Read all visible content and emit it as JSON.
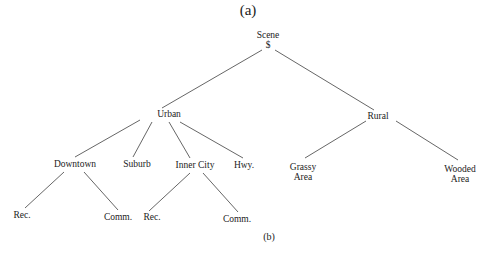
{
  "captions": {
    "top": "(a)",
    "bottom": "(b)"
  },
  "tree": {
    "root": {
      "label": "Scene",
      "sublabel": "$"
    },
    "nodes": {
      "urban": "Urban",
      "rural": "Rural",
      "downtown": "Downtown",
      "suburb": "Suburb",
      "inner_city": "Inner City",
      "hwy": "Hwy.",
      "grassy_area_1": "Grassy",
      "grassy_area_2": "Area",
      "wooded_area_1": "Wooded",
      "wooded_area_2": "Area",
      "downtown_rec": "Rec.",
      "downtown_comm": "Comm.",
      "inner_city_rec": "Rec.",
      "inner_city_comm": "Comm."
    },
    "edges": [
      [
        "Scene",
        "Urban"
      ],
      [
        "Scene",
        "Rural"
      ],
      [
        "Urban",
        "Downtown"
      ],
      [
        "Urban",
        "Suburb"
      ],
      [
        "Urban",
        "Inner City"
      ],
      [
        "Urban",
        "Hwy."
      ],
      [
        "Rural",
        "Grassy Area"
      ],
      [
        "Rural",
        "Wooded Area"
      ],
      [
        "Downtown",
        "Rec."
      ],
      [
        "Downtown",
        "Comm."
      ],
      [
        "Inner City",
        "Rec."
      ],
      [
        "Inner City",
        "Comm."
      ]
    ]
  },
  "colors": {
    "line": "#555555",
    "text": "#222222"
  }
}
